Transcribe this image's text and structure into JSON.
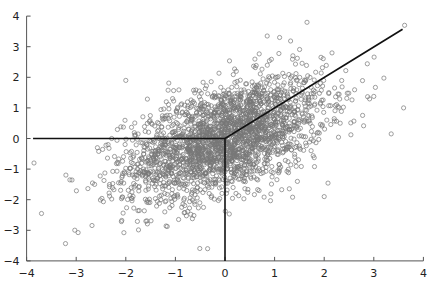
{
  "chart_data": {
    "type": "scatter",
    "title": "",
    "xlabel": "",
    "ylabel": "",
    "xlim": [
      -4,
      4
    ],
    "ylim": [
      -4,
      4
    ],
    "x_ticks": [
      -4,
      -3,
      -2,
      -1,
      0,
      1,
      2,
      3,
      4
    ],
    "y_ticks": [
      -4,
      -3,
      -2,
      -1,
      0,
      1,
      2,
      3,
      4
    ],
    "x_tick_labels": [
      "−4",
      "−3",
      "−2",
      "−1",
      "0",
      "1",
      "2",
      "3",
      "4"
    ],
    "y_tick_labels": [
      "−4",
      "−3",
      "−2",
      "−1",
      "0",
      "1",
      "2",
      "3",
      "4"
    ],
    "grid": false,
    "legend": null,
    "marker": {
      "shape": "open-circle",
      "radius": 2.1,
      "color": "#777777"
    },
    "series": [
      {
        "name": "samples",
        "distribution": "bivariate-normal",
        "n_points": 2500,
        "mean": [
          0,
          0
        ],
        "sd": [
          1.0,
          1.0
        ],
        "correlation": 0.5,
        "approx_extremes": [
          {
            "x": -3.85,
            "y": -0.8
          },
          {
            "x": -3.7,
            "y": -2.45
          },
          {
            "x": 0.85,
            "y": 3.35
          },
          {
            "x": 1.1,
            "y": 3.3
          },
          {
            "x": 3.6,
            "y": 1.0
          },
          {
            "x": 3.35,
            "y": 0.15
          },
          {
            "x": -0.35,
            "y": -3.6
          },
          {
            "x": 2.0,
            "y": -1.9
          },
          {
            "x": -2.0,
            "y": 1.9
          }
        ]
      }
    ],
    "annotations": [
      {
        "type": "line",
        "name": "horizontal-ray",
        "from": [
          -3.87,
          0
        ],
        "to": [
          0,
          0
        ],
        "color": "#111111"
      },
      {
        "type": "line",
        "name": "vertical-ray",
        "from": [
          0,
          0
        ],
        "to": [
          0,
          -4
        ],
        "color": "#111111"
      },
      {
        "type": "line",
        "name": "diagonal-ray",
        "from": [
          0,
          0
        ],
        "to": [
          3.58,
          3.57
        ],
        "color": "#111111"
      }
    ]
  },
  "layout": {
    "x0_px": 225,
    "px_per_x": 49.6,
    "y0_px": 138.5,
    "px_per_y": 30.6,
    "seed": 12345
  }
}
